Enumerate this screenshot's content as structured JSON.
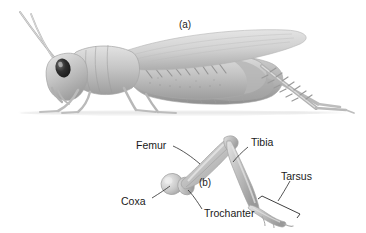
{
  "figure": {
    "title_a": "(a)",
    "title_b": "(b)",
    "panels": [
      {
        "id": "a",
        "label": "(a)",
        "caption": "grasshopper whole body lateral view"
      },
      {
        "id": "b",
        "label": "(b)",
        "caption": "grasshopper hind leg segments"
      }
    ]
  },
  "panel_a": {
    "label": "(a)",
    "subject": "grasshopper",
    "view": "lateral"
  },
  "panel_b": {
    "label": "(b)",
    "subject": "hind leg",
    "labels": [
      {
        "key": "femur",
        "text": "Femur"
      },
      {
        "key": "tibia",
        "text": "Tibia"
      },
      {
        "key": "tarsus",
        "text": "Tarsus"
      },
      {
        "key": "coxa",
        "text": "Coxa"
      },
      {
        "key": "trochanter",
        "text": "Trochanter"
      }
    ]
  },
  "colors": {
    "background": "#ffffff",
    "body_light": "#d8d8d8",
    "body_mid": "#b4b4b4",
    "body_dark": "#8f8f8f",
    "outline": "#9a9a9a",
    "eye": "#2b2b2b",
    "text": "#1a1a1a",
    "leader": "#2a2a2a",
    "ground": "#e4e4e4"
  }
}
